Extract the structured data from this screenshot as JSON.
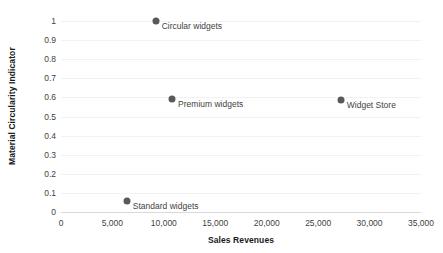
{
  "chart_data": {
    "type": "scatter",
    "title": "",
    "xlabel": "Sales Revenues",
    "ylabel": "Material Circularity Indicator",
    "xlim": [
      0,
      35000
    ],
    "ylim": [
      0,
      1
    ],
    "grid": true,
    "legend": "none",
    "x_ticks": [
      "0",
      "5,000",
      "10,000",
      "15,000",
      "20,000",
      "25,000",
      "30,000",
      "35,000"
    ],
    "x_tick_values": [
      0,
      5000,
      10000,
      15000,
      20000,
      25000,
      30000,
      35000
    ],
    "y_ticks": [
      "1",
      "0.9",
      "0.8",
      "0.7",
      "0.6",
      "0.5",
      "0.4",
      "0.3",
      "0.2",
      "0.1",
      "0"
    ],
    "y_tick_values": [
      1,
      0.9,
      0.8,
      0.7,
      0.6,
      0.5,
      0.4,
      0.3,
      0.2,
      0.1,
      0
    ],
    "marker_color": "#595959",
    "points": [
      {
        "label": "Circular widgets",
        "x": 9200,
        "y": 1.0
      },
      {
        "label": "Premium widgets",
        "x": 10800,
        "y": 0.59
      },
      {
        "label": "Widget Store",
        "x": 27200,
        "y": 0.585
      },
      {
        "label": "Standard widgets",
        "x": 6400,
        "y": 0.06
      }
    ]
  }
}
